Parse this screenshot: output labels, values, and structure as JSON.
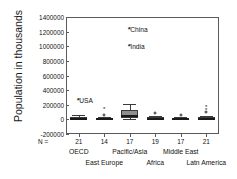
{
  "chart_data": {
    "type": "box",
    "title": "",
    "xlabel": "",
    "ylabel": "Population in thousands",
    "ylim": [
      -200000,
      1400000
    ],
    "ytick_labels": [
      "1400000",
      "1200000",
      "1000000",
      "800000",
      "600000",
      "400000",
      "200000",
      "0",
      "-200000"
    ],
    "ytick_values": [
      1400000,
      1200000,
      1000000,
      800000,
      600000,
      400000,
      200000,
      0,
      -200000
    ],
    "grid": false,
    "legend": "none",
    "n_prefix": "N =",
    "categories": [
      "OECD",
      "East Europe",
      "Pacific/Asia",
      "Africa",
      "Middle East",
      "Latn America"
    ],
    "n_counts": [
      "21",
      "14",
      "17",
      "19",
      "17",
      "21"
    ],
    "boxes": [
      {
        "category": "OECD",
        "q1": 5000,
        "median": 10000,
        "q3": 38000,
        "whisker_low": 2000,
        "whisker_high": 62000
      },
      {
        "category": "East Europe",
        "q1": 4000,
        "median": 10000,
        "q3": 22000,
        "whisker_low": 1000,
        "whisker_high": 38000
      },
      {
        "category": "Pacific/Asia",
        "q1": 20000,
        "median": 48000,
        "q3": 128000,
        "whisker_low": 4000,
        "whisker_high": 210000
      },
      {
        "category": "Africa",
        "q1": 4000,
        "median": 11000,
        "q3": 28000,
        "whisker_low": 1000,
        "whisker_high": 52000
      },
      {
        "category": "Middle East",
        "q1": 3000,
        "median": 8000,
        "q3": 20000,
        "whisker_low": 800,
        "whisker_high": 38000
      },
      {
        "category": "Latn America",
        "q1": 4000,
        "median": 10000,
        "q3": 26000,
        "whisker_low": 1000,
        "whisker_high": 48000
      }
    ],
    "outliers": [
      {
        "category": "OECD",
        "value": 260000,
        "marker": "star",
        "label": "*USA"
      },
      {
        "category": "East Europe",
        "value": 148000,
        "marker": "star",
        "label": ""
      },
      {
        "category": "East Europe",
        "value": 58000,
        "marker": "circle",
        "label": ""
      },
      {
        "category": "Pacific/Asia",
        "value": 1230000,
        "marker": "star",
        "label": "*China"
      },
      {
        "category": "Pacific/Asia",
        "value": 1010000,
        "marker": "star",
        "label": "*India"
      },
      {
        "category": "Africa",
        "value": 82000,
        "marker": "circle",
        "label": ""
      },
      {
        "category": "Middle East",
        "value": 66000,
        "marker": "circle",
        "label": ""
      },
      {
        "category": "Latn America",
        "value": 168000,
        "marker": "star",
        "label": ""
      },
      {
        "category": "Latn America",
        "value": 122000,
        "marker": "star",
        "label": ""
      },
      {
        "category": "Latn America",
        "value": 98000,
        "marker": "circle",
        "label": ""
      }
    ],
    "annotations": [
      {
        "text": "*USA",
        "value": 260000
      },
      {
        "text": "*China",
        "value": 1230000
      },
      {
        "text": "*India",
        "value": 1010000
      }
    ]
  },
  "axis": {
    "y_title": "Population in thousands",
    "n_prefix": "N ="
  },
  "ticks": {
    "y": [
      "1400000",
      "1200000",
      "1000000",
      "800000",
      "600000",
      "400000",
      "200000",
      "0",
      "-200000"
    ]
  },
  "categories": {
    "row1": [
      {
        "label": "OECD",
        "n": "21"
      },
      {
        "label": "Pacific/Asia",
        "n": "17"
      },
      {
        "label": "Middle East",
        "n": "17"
      }
    ],
    "row2": [
      {
        "label": "East Europe",
        "n": "14"
      },
      {
        "label": "Africa",
        "n": "19"
      },
      {
        "label": "Latn America",
        "n": "21"
      }
    ]
  },
  "n_values": [
    "21",
    "14",
    "17",
    "19",
    "17",
    "21"
  ],
  "annotations": {
    "usa": "*USA",
    "china": "*China",
    "india": "*India"
  },
  "colors": {
    "box_fill": "#8f8f8f",
    "box_edge": "#3a3a3a",
    "median": "#1a1a1a",
    "axis": "#5a5a5a",
    "text": "#111111",
    "background": "#ffffff"
  }
}
